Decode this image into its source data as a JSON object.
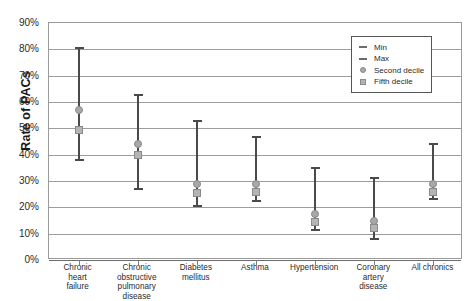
{
  "chart_data": {
    "type": "scatter",
    "title": "",
    "xlabel": "",
    "ylabel": "Rate of PACs",
    "ylim": [
      0,
      90
    ],
    "ytick_labels": [
      "90%",
      "80%",
      "70%",
      "60%",
      "50%",
      "40%",
      "30%",
      "20%",
      "10%",
      "0%"
    ],
    "ytick_values": [
      90,
      80,
      70,
      60,
      50,
      40,
      30,
      20,
      10,
      0
    ],
    "grid": true,
    "legend_position": "top-right",
    "legend": [
      "Min",
      "Max",
      "Second decile",
      "Fifth decile"
    ],
    "categories": [
      "Chronic heart failure",
      "Chronic obstructive pulmonary disease",
      "Diabetes mellitus",
      "Asthma",
      "Hypertension",
      "Coronary artery disease",
      "All chronics"
    ],
    "category_label_lines": [
      [
        "Chronic",
        "heart",
        "failure"
      ],
      [
        "Chronic",
        "obstructive",
        "pulmonary",
        "disease"
      ],
      [
        "Diabetes",
        "mellitus"
      ],
      [
        "Asthma"
      ],
      [
        "Hypertension"
      ],
      [
        "Coronary",
        "artery",
        "disease"
      ],
      [
        "All chronics"
      ]
    ],
    "series": [
      {
        "name": "Min",
        "values": [
          38.0,
          27.0,
          20.5,
          22.5,
          11.5,
          8.0,
          23.0
        ]
      },
      {
        "name": "Max",
        "values": [
          81.0,
          63.0,
          53.0,
          47.0,
          35.5,
          31.5,
          44.5
        ]
      },
      {
        "name": "Second decile",
        "values": [
          57.0,
          44.0,
          29.0,
          29.0,
          17.5,
          15.0,
          29.0
        ]
      },
      {
        "name": "Fifth decile",
        "values": [
          49.5,
          40.0,
          25.5,
          26.0,
          14.5,
          12.0,
          26.0
        ]
      }
    ]
  },
  "legend": {
    "items": [
      {
        "label": "Min",
        "icon": "dash-icon"
      },
      {
        "label": "Max",
        "icon": "dash-icon"
      },
      {
        "label": "Second decile",
        "icon": "circle-marker-icon"
      },
      {
        "label": "Fifth decile",
        "icon": "square-marker-icon"
      }
    ]
  },
  "colors": {
    "whisker": "#4a4a4a",
    "gridline": "#9d9d9d",
    "second_decile": "#a8a8a8",
    "fifth_decile": "#b4b4b4",
    "text": "#2b2b2b"
  }
}
